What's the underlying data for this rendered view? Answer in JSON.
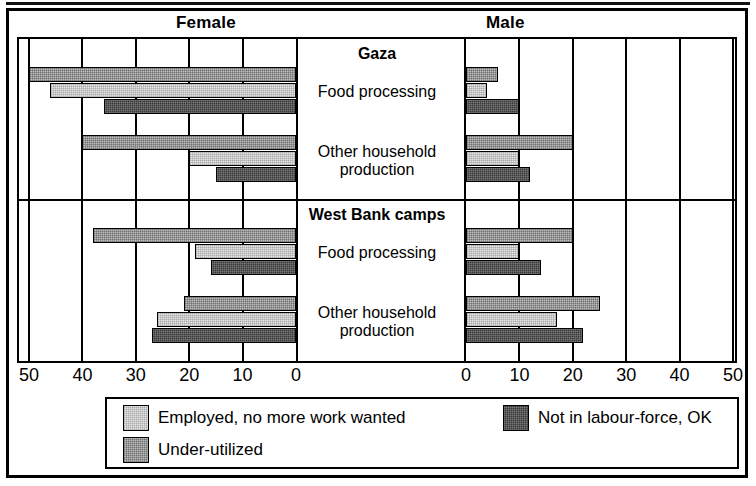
{
  "chart_data": {
    "type": "bar",
    "orientation": "horizontal",
    "style": "paired population pyramid, grouped by sex",
    "title": "",
    "xlabel": "",
    "ylabel": "",
    "axis": {
      "left_side_label": "Female",
      "right_side_label": "Male",
      "ticks_left": [
        50,
        40,
        30,
        20,
        10,
        0
      ],
      "ticks_right": [
        0,
        10,
        20,
        30,
        40,
        50
      ],
      "xlim": [
        0,
        50
      ],
      "grid": true,
      "grid_step": 10
    },
    "legend": {
      "position": "bottom",
      "entries": [
        {
          "key": "employed",
          "label": "Employed, no more work wanted",
          "swatch": "light-stipple"
        },
        {
          "key": "notlf",
          "label": "Not in labour-force, OK",
          "swatch": "dark-stipple"
        },
        {
          "key": "under",
          "label": "Under-utilized",
          "swatch": "medium-stipple"
        }
      ]
    },
    "series_order": [
      "under",
      "employed",
      "notlf"
    ],
    "panels": [
      {
        "id": "gaza",
        "title": "Gaza",
        "categories": [
          {
            "label": "Food processing",
            "label_lines": [
              "Food processing"
            ],
            "female": {
              "under": 50,
              "employed": 46,
              "notlf": 36
            },
            "male": {
              "under": 6,
              "employed": 4,
              "notlf": 10
            }
          },
          {
            "label": "Other household production",
            "label_lines": [
              "Other household",
              "production"
            ],
            "female": {
              "under": 40,
              "employed": 20,
              "notlf": 15
            },
            "male": {
              "under": 20,
              "employed": 10,
              "notlf": 12
            }
          }
        ]
      },
      {
        "id": "west-bank-camps",
        "title": "West Bank camps",
        "categories": [
          {
            "label": "Food processing",
            "label_lines": [
              "Food processing"
            ],
            "female": {
              "under": 38,
              "employed": 19,
              "notlf": 16
            },
            "male": {
              "under": 20,
              "employed": 10,
              "notlf": 14
            }
          },
          {
            "label": "Other household production",
            "label_lines": [
              "Other household",
              "production"
            ],
            "female": {
              "under": 21,
              "employed": 26,
              "notlf": 27
            },
            "male": {
              "under": 25,
              "employed": 17,
              "notlf": 22
            }
          }
        ]
      }
    ]
  },
  "colors": {
    "employed": "#e4e4e4",
    "under": "#bdbdbd",
    "notlf": "#3a3a3a",
    "frame": "#000000",
    "background": "#ffffff"
  }
}
